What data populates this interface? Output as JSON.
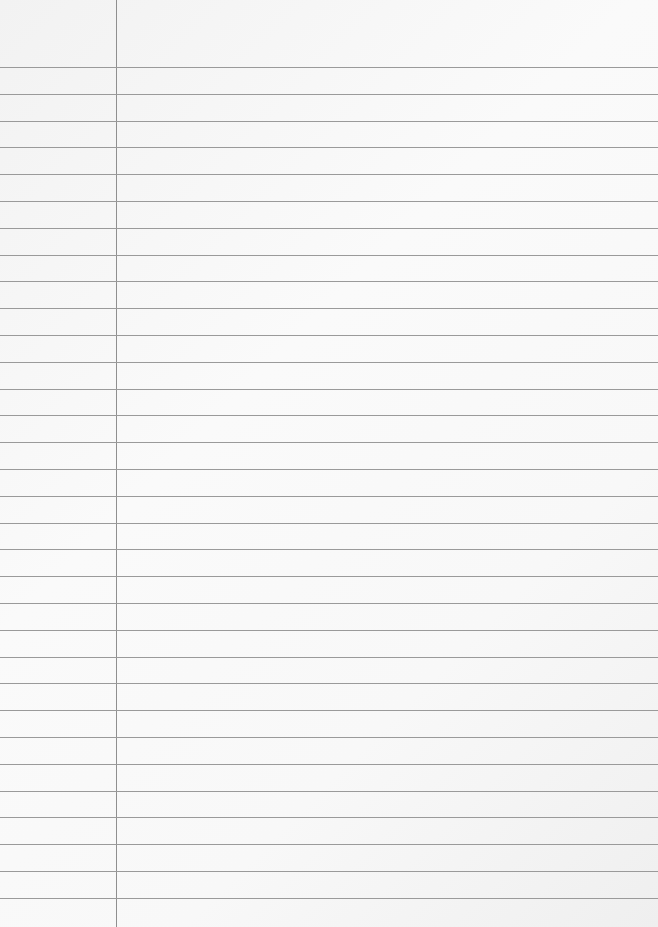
{
  "paper": {
    "type": "ruled-notebook-page",
    "margin_line_x": 116,
    "first_rule_y": 67,
    "rule_spacing": 26.8,
    "rule_count": 32,
    "rule_color": "#9a9a9a",
    "margin_color": "#8f8f8f",
    "background": "#f7f7f7"
  }
}
